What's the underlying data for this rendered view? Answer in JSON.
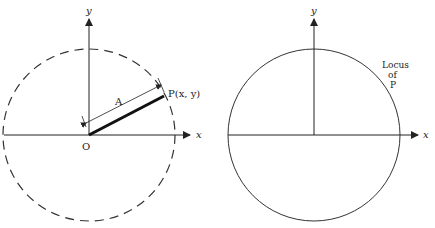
{
  "figure_left": {
    "y_axis_label": "y",
    "x_axis_label": "x",
    "origin_label": "O",
    "point_label": "P(x, y)",
    "radius_label": "A",
    "circle_style": "dashed",
    "stroke_color": "#222222"
  },
  "figure_right": {
    "y_axis_label": "y",
    "x_axis_label": "x",
    "locus_label_lines": [
      "Locus",
      "of",
      "P"
    ],
    "circle_style": "solid",
    "stroke_color": "#222222"
  }
}
